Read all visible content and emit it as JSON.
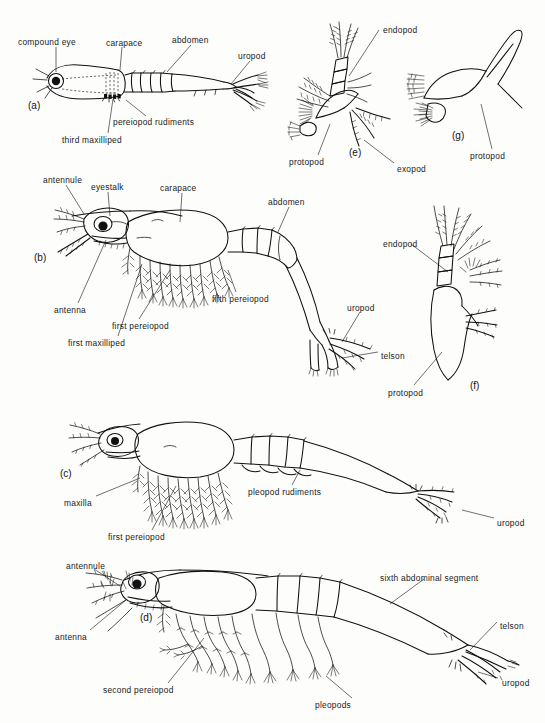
{
  "figure": {
    "width": 545,
    "height": 723,
    "background_color": "#fdfdfc",
    "ink_color": "#111111"
  },
  "panels": [
    {
      "id": "a",
      "label": "(a)",
      "x": 28,
      "y": 100,
      "description": "early post-larva, lateral view with carapace, abdomen, uropod"
    },
    {
      "id": "b",
      "label": "(b)",
      "x": 34,
      "y": 252,
      "description": "mysis stage larva, lateral view with eyestalk, carapace, pereiopods, telson"
    },
    {
      "id": "c",
      "label": "(c)",
      "x": 60,
      "y": 468,
      "description": "larva with maxilla, first pereiopod, pleopod rudiments, uropod"
    },
    {
      "id": "d",
      "label": "(d)",
      "x": 140,
      "y": 612,
      "description": "post-larva with antennule, antenna, pleopods, sixth abdominal segment, telson, uropod"
    },
    {
      "id": "e",
      "label": "(e)",
      "x": 349,
      "y": 147,
      "description": "detail of biramous appendage with protopod, endopod and exopod"
    },
    {
      "id": "f",
      "label": "(f)",
      "x": 470,
      "y": 380,
      "description": "detail of appendage with endopod and protopod"
    },
    {
      "id": "g",
      "label": "(g)",
      "x": 452,
      "y": 130,
      "description": "detail of simple appendage with protopod"
    }
  ],
  "labels": [
    {
      "text": "compound eye",
      "x": 18,
      "y": 38,
      "panel": "a"
    },
    {
      "text": "carapace",
      "x": 106,
      "y": 39,
      "panel": "a"
    },
    {
      "text": "abdomen",
      "x": 172,
      "y": 36,
      "panel": "a"
    },
    {
      "text": "uropod",
      "x": 238,
      "y": 52,
      "panel": "a"
    },
    {
      "text": "pereiopod rudiments",
      "x": 113,
      "y": 118,
      "panel": "a"
    },
    {
      "text": "third maxilliped",
      "x": 62,
      "y": 136,
      "panel": "a"
    },
    {
      "text": "endopod",
      "x": 383,
      "y": 26,
      "panel": "e"
    },
    {
      "text": "protopod",
      "x": 289,
      "y": 158,
      "panel": "e"
    },
    {
      "text": "exopod",
      "x": 397,
      "y": 165,
      "panel": "e"
    },
    {
      "text": "protopod",
      "x": 470,
      "y": 152,
      "panel": "g"
    },
    {
      "text": "antennule",
      "x": 43,
      "y": 176,
      "panel": "b"
    },
    {
      "text": "eyestalk",
      "x": 91,
      "y": 183,
      "panel": "b"
    },
    {
      "text": "carapace",
      "x": 160,
      "y": 184,
      "panel": "b"
    },
    {
      "text": "abdomen",
      "x": 268,
      "y": 198,
      "panel": "b"
    },
    {
      "text": "antenna",
      "x": 54,
      "y": 306,
      "panel": "b"
    },
    {
      "text": "first pereiopod",
      "x": 112,
      "y": 322,
      "panel": "b"
    },
    {
      "text": "first maxilliped",
      "x": 68,
      "y": 339,
      "panel": "b"
    },
    {
      "text": "fifth pereiopod",
      "x": 212,
      "y": 295,
      "panel": "b"
    },
    {
      "text": "uropod",
      "x": 347,
      "y": 304,
      "panel": "b"
    },
    {
      "text": "telson",
      "x": 381,
      "y": 352,
      "panel": "b"
    },
    {
      "text": "endopod",
      "x": 383,
      "y": 240,
      "panel": "f"
    },
    {
      "text": "protopod",
      "x": 388,
      "y": 389,
      "panel": "f"
    },
    {
      "text": "maxilla",
      "x": 64,
      "y": 499,
      "panel": "c"
    },
    {
      "text": "first pereiopod",
      "x": 108,
      "y": 533,
      "panel": "c"
    },
    {
      "text": "pleopod rudiments",
      "x": 248,
      "y": 488,
      "panel": "c"
    },
    {
      "text": "uropod",
      "x": 497,
      "y": 519,
      "panel": "c"
    },
    {
      "text": "antennule",
      "x": 66,
      "y": 562,
      "panel": "d"
    },
    {
      "text": "antenna",
      "x": 55,
      "y": 633,
      "panel": "d"
    },
    {
      "text": "second pereiopod",
      "x": 103,
      "y": 686,
      "panel": "d"
    },
    {
      "text": "sixth abdominal segment",
      "x": 380,
      "y": 574,
      "panel": "d"
    },
    {
      "text": "pleopods",
      "x": 315,
      "y": 701,
      "panel": "d"
    },
    {
      "text": "telson",
      "x": 500,
      "y": 622,
      "panel": "d"
    },
    {
      "text": "uropod",
      "x": 502,
      "y": 679,
      "panel": "d"
    }
  ],
  "terms_glossary": [
    "compound eye",
    "carapace",
    "abdomen",
    "uropod",
    "pereiopod rudiments",
    "third maxilliped",
    "endopod",
    "protopod",
    "exopod",
    "antennule",
    "eyestalk",
    "antenna",
    "first pereiopod",
    "first maxilliped",
    "fifth pereiopod",
    "telson",
    "maxilla",
    "pleopod rudiments",
    "second pereiopod",
    "sixth abdominal segment",
    "pleopods"
  ]
}
